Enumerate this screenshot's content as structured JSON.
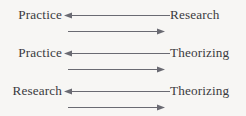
{
  "diagram": {
    "background_color": "#f7f6f4",
    "text_color": "#3a3a3e",
    "arrow_color": "#6a6a72",
    "rows": [
      {
        "left_label": "Practice",
        "right_label": "Research",
        "upper_arrow": {
          "direction": "left",
          "from": "Research",
          "to": "Practice",
          "icon": "arrow-left-icon"
        },
        "lower_arrow": {
          "direction": "right",
          "from": "Practice",
          "to": "Research",
          "icon": "arrow-right-icon"
        }
      },
      {
        "left_label": "Practice",
        "right_label": "Theorizing",
        "upper_arrow": {
          "direction": "left",
          "from": "Theorizing",
          "to": "Practice",
          "icon": "arrow-left-icon"
        },
        "lower_arrow": {
          "direction": "right",
          "from": "Practice",
          "to": "Theorizing",
          "icon": "arrow-right-icon"
        }
      },
      {
        "left_label": "Research",
        "right_label": "Theorizing",
        "upper_arrow": {
          "direction": "left",
          "from": "Theorizing",
          "to": "Research",
          "icon": "arrow-left-icon"
        },
        "lower_arrow": {
          "direction": "right",
          "from": "Research",
          "to": "Theorizing",
          "icon": "arrow-right-icon"
        }
      }
    ]
  }
}
